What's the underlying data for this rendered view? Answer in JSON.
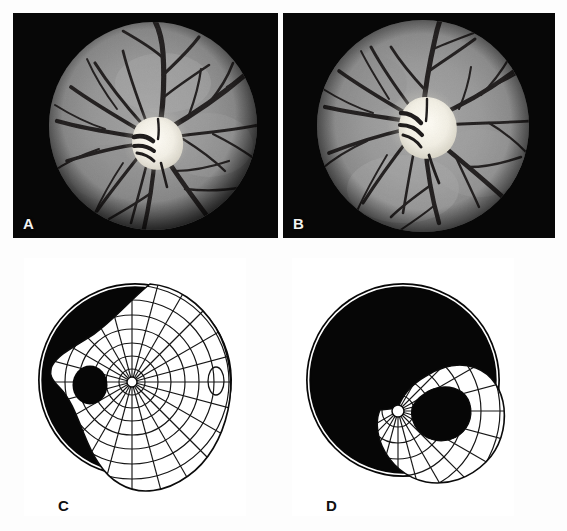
{
  "figure": {
    "caption_panels": [
      "A",
      "B",
      "C",
      "D"
    ],
    "panel_count": 4,
    "background_color": "#ffffff"
  },
  "panels": [
    {
      "id": "A",
      "label": "A",
      "type": "fundus-photograph",
      "eye": "right",
      "frame": {
        "x": 13,
        "y": 13,
        "w": 265,
        "h": 225
      },
      "background_color": "#070707",
      "retina_color": "#8d8d8d",
      "disc_color": "#f6f4ee",
      "vessel_color": "#221f1f",
      "fundus_circle": {
        "cx": 140,
        "cy": 113,
        "r": 104
      },
      "optic_disc": {
        "cx": 143,
        "cy": 128,
        "rx": 22,
        "ry": 24
      },
      "description": "Grayscale fundus photograph, pale swollen optic disc with blurred margins and vessels radiating outward"
    },
    {
      "id": "B",
      "label": "B",
      "type": "fundus-photograph",
      "eye": "left",
      "frame": {
        "x": 283,
        "y": 13,
        "w": 272,
        "h": 225
      },
      "background_color": "#070707",
      "retina_color": "#8d8d8d",
      "disc_color": "#f6f4ee",
      "vessel_color": "#221f1f",
      "fundus_circle": {
        "cx": 140,
        "cy": 113,
        "r": 106
      },
      "optic_disc": {
        "cx": 140,
        "cy": 110,
        "rx": 24,
        "ry": 26
      },
      "description": "Grayscale fundus photograph, rounded pale optic disc with peripapillary halo and arcuate vessels"
    },
    {
      "id": "C",
      "label": "C",
      "type": "goldmann-visual-field",
      "eye": "right",
      "frame": {
        "x": 24,
        "y": 258,
        "w": 222,
        "h": 258
      },
      "chart_color": "#050505",
      "seeing_area_color": "#ffffff",
      "grid_color": "#151515",
      "outer_circle": {
        "cx": 111,
        "cy": 122,
        "r": 97
      },
      "fixation_point": {
        "cx": 108,
        "cy": 124,
        "r": 5
      },
      "blind_spot": {
        "cx": 66,
        "cy": 127,
        "rx": 17,
        "ry": 19
      },
      "description": "Large residual seeing island with dense grid; physiologic blind spot enlarged, nasal and superior field constricted"
    },
    {
      "id": "D",
      "label": "D",
      "type": "goldmann-visual-field",
      "eye": "left",
      "frame": {
        "x": 292,
        "y": 258,
        "w": 222,
        "h": 258
      },
      "chart_color": "#050505",
      "seeing_area_color": "#ffffff",
      "grid_color": "#151515",
      "outer_circle": {
        "cx": 111,
        "cy": 122,
        "r": 97
      },
      "fixation_point": {
        "cx": 108,
        "cy": 155,
        "r": 6
      },
      "description": "Severely constricted field; only an inferotemporal crescent of vision remains around an absolute central and superior scotoma"
    }
  ],
  "chart_data": {
    "type": "scatter",
    "xlabel": "Horizontal meridian (degrees)",
    "ylabel": "Vertical meridian (degrees)",
    "xlim": [
      -90,
      90
    ],
    "ylim": [
      -90,
      90
    ],
    "grid": true,
    "legend_position": "none",
    "meridian_spacing_degrees": 15,
    "isopter_ring_degrees": [
      10,
      20,
      30,
      40,
      50,
      60,
      70,
      80,
      90
    ],
    "series": [
      {
        "name": "C — right eye residual field",
        "notes": "Seeing area boundary sampled every 15 degrees, radius in degrees from fixation",
        "angles": [
          0,
          15,
          30,
          45,
          60,
          75,
          90,
          105,
          120,
          135,
          150,
          165,
          180,
          195,
          210,
          225,
          240,
          255,
          270,
          285,
          300,
          315,
          330,
          345
        ],
        "radii": [
          72,
          74,
          72,
          66,
          58,
          48,
          42,
          40,
          40,
          42,
          44,
          46,
          48,
          52,
          56,
          60,
          66,
          70,
          72,
          74,
          76,
          78,
          76,
          74
        ],
        "blind_spot": {
          "angle_degrees": 180,
          "radius_degrees": 40,
          "size_degrees": 16
        }
      },
      {
        "name": "D — left eye residual crescent",
        "notes": "Only an inferotemporal island remains; fixation sits at the crescent apex",
        "angles": [
          285,
          300,
          315,
          330,
          345,
          0,
          15,
          30,
          45,
          60,
          75
        ],
        "radii": [
          30,
          42,
          54,
          62,
          66,
          64,
          58,
          48,
          36,
          24,
          14
        ],
        "scotoma": {
          "type": "absolute",
          "covers": "central and superior field"
        }
      }
    ]
  }
}
